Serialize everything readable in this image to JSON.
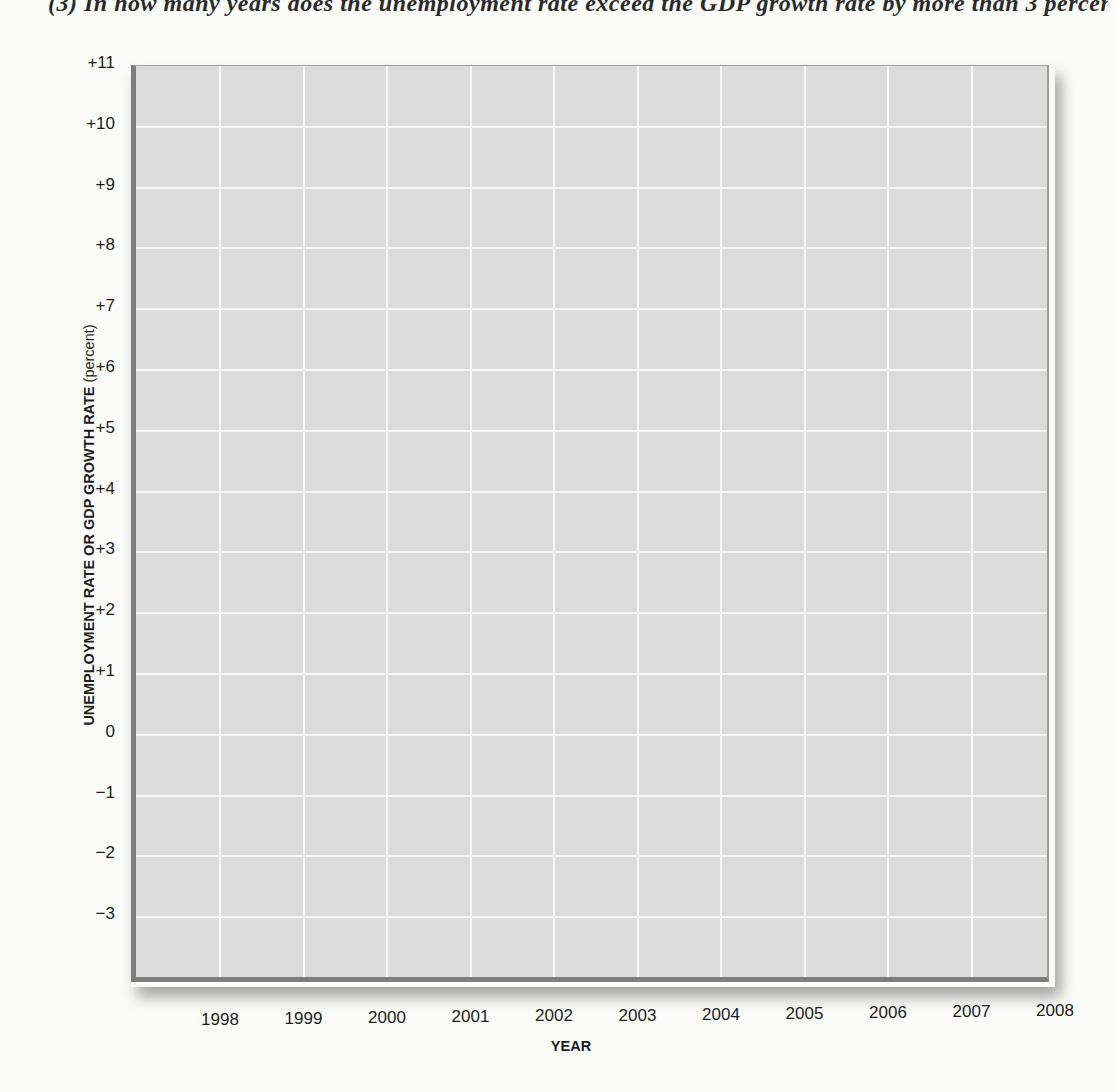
{
  "page": {
    "question_text": "(3) In how many years does the unemployment rate exceed the GDP growth rate by more than 3 percentage"
  },
  "chart_data": {
    "type": "line",
    "title": "",
    "xlabel": "YEAR",
    "ylabel": "UNEMPLOYMENT RATE OR GDP GROWTH RATE",
    "ylabel_unit": "(percent)",
    "categories": [
      "1998",
      "1999",
      "2000",
      "2001",
      "2002",
      "2003",
      "2004",
      "2005",
      "2006",
      "2007",
      "2008"
    ],
    "series": [],
    "y_ticks": [
      "+11",
      "+10",
      "+9",
      "+8",
      "+7",
      "+6",
      "+5",
      "+4",
      "+3",
      "+2",
      "+1",
      "0",
      "−1",
      "−2",
      "−3"
    ],
    "ylim": [
      -4,
      11
    ],
    "grid": true,
    "legend": "none",
    "note": "Blank worksheet grid; no data plotted",
    "colors": {
      "plot_background": "#dcdcdc",
      "gridline": "#f7f7f7",
      "axis_border": "#7e7e7e"
    }
  }
}
